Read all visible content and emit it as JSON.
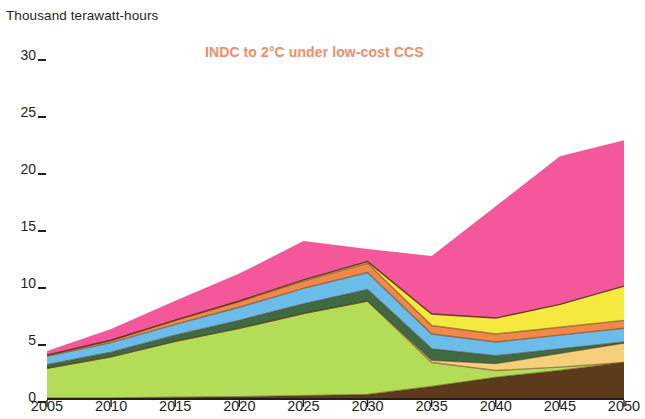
{
  "axis_unit_label": "Thousand terawatt-hours",
  "title": "INDC to 2°C under low-cost CCS",
  "title_color": "#f08c6a",
  "y_ticks": [
    "30",
    "25",
    "20",
    "15",
    "10",
    "5",
    "0"
  ],
  "x_ticks": [
    "2005",
    "2010",
    "2015",
    "2020",
    "2025",
    "2030",
    "2035",
    "2040",
    "2045",
    "2050"
  ],
  "chart_data": {
    "type": "area",
    "stacked": true,
    "title": "INDC to 2°C under low-cost CCS",
    "subtitle": "",
    "xlabel": "",
    "ylabel": "Thousand terawatt-hours",
    "xlim": [
      2005,
      2050
    ],
    "ylim": [
      0,
      30
    ],
    "ytick_values": [
      0,
      5,
      10,
      15,
      20,
      25,
      30
    ],
    "xtick_values": [
      2005,
      2010,
      2015,
      2020,
      2025,
      2030,
      2035,
      2040,
      2045,
      2050
    ],
    "grid": false,
    "legend": "none",
    "x": [
      2005,
      2010,
      2015,
      2020,
      2025,
      2030,
      2035,
      2040,
      2045,
      2050
    ],
    "series": [
      {
        "name": "Biomass with CCS",
        "color": "#5c3a1c",
        "values": [
          0.1,
          0.1,
          0.15,
          0.2,
          0.3,
          0.4,
          1.1,
          1.9,
          2.5,
          3.2
        ]
      },
      {
        "name": "Coal",
        "color": "#b3dd57",
        "values": [
          2.6,
          3.6,
          4.9,
          6.0,
          7.2,
          8.2,
          2.1,
          0.6,
          0.3,
          0.0
        ]
      },
      {
        "name": "Gas",
        "color": "#f5cf7a",
        "values": [
          0.0,
          0.0,
          0.0,
          0.0,
          0.0,
          0.0,
          0.2,
          0.6,
          1.2,
          1.7
        ]
      },
      {
        "name": "Nuclear",
        "color": "#3f6b43",
        "values": [
          0.3,
          0.4,
          0.55,
          0.7,
          0.85,
          1.0,
          1.0,
          0.7,
          0.4,
          0.1
        ]
      },
      {
        "name": "Hydro",
        "color": "#6bbce8",
        "values": [
          0.75,
          0.85,
          0.95,
          1.15,
          1.35,
          1.5,
          1.3,
          1.2,
          1.2,
          1.2
        ]
      },
      {
        "name": "Wind",
        "color": "#f0884a",
        "values": [
          0.1,
          0.2,
          0.35,
          0.5,
          0.65,
          0.8,
          0.75,
          0.7,
          0.7,
          0.7
        ]
      },
      {
        "name": "Solar",
        "color": "#f5e940",
        "values": [
          0.0,
          0.0,
          0.02,
          0.05,
          0.1,
          0.15,
          1.0,
          1.4,
          2.0,
          3.0
        ]
      },
      {
        "name": "Other renewables",
        "color": "#f4589b",
        "values": [
          0.35,
          1.0,
          1.7,
          2.4,
          3.4,
          1.1,
          5.1,
          9.8,
          13.0,
          12.8
        ]
      }
    ],
    "stack_tops": {
      "2005": [
        0.1,
        2.7,
        2.7,
        3.0,
        3.75,
        3.85,
        3.85,
        4.2
      ],
      "2010": [
        0.1,
        3.7,
        3.7,
        4.1,
        4.95,
        5.15,
        5.15,
        6.15
      ],
      "2015": [
        0.15,
        5.05,
        5.05,
        5.6,
        6.55,
        6.9,
        6.92,
        8.62
      ],
      "2020": [
        0.2,
        6.2,
        6.2,
        6.9,
        8.05,
        8.55,
        8.6,
        11.0
      ],
      "2025": [
        0.3,
        7.5,
        7.5,
        8.35,
        9.7,
        10.35,
        10.45,
        13.85
      ],
      "2030": [
        0.4,
        8.6,
        8.6,
        9.6,
        11.1,
        11.9,
        12.05,
        13.15
      ],
      "2035": [
        1.1,
        3.2,
        3.4,
        4.4,
        5.7,
        6.45,
        7.45,
        12.55
      ],
      "2040": [
        1.9,
        2.5,
        3.1,
        3.8,
        5.0,
        5.7,
        7.1,
        16.9
      ],
      "2045": [
        2.5,
        2.8,
        4.0,
        4.4,
        5.6,
        6.3,
        8.3,
        21.3
      ],
      "2050": [
        3.2,
        3.2,
        4.9,
        5.0,
        6.2,
        6.9,
        9.9,
        22.7
      ]
    }
  },
  "palette": {
    "biomass_ccs": "#5c3a1c",
    "coal": "#b3dd57",
    "gas": "#f5cf7a",
    "nuclear": "#3f6b43",
    "hydro": "#6bbce8",
    "wind": "#f0884a",
    "solar": "#f5e940",
    "other_renewables": "#f4589b",
    "axis": "#231f20",
    "separator": "#5c3a1c"
  }
}
